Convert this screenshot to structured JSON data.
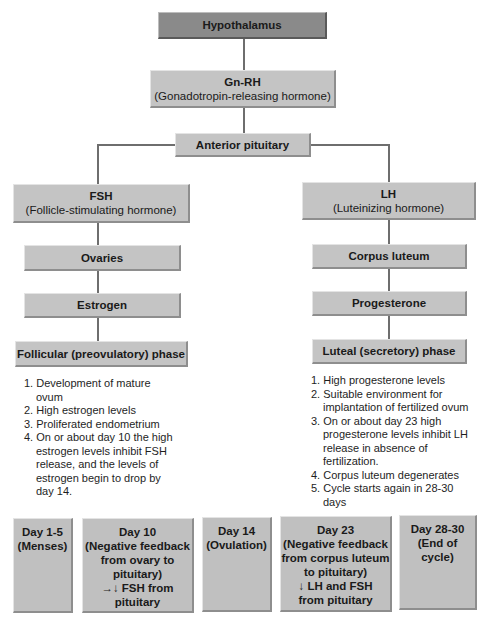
{
  "top": {
    "hypothalamus": "Hypothalamus",
    "gnrh_title": "Gn-RH",
    "gnrh_sub": "(Gonadotropin-releasing hormone)",
    "anterior_pituitary": "Anterior pituitary"
  },
  "left": {
    "fsh_title": "FSH",
    "fsh_sub": "(Follicle-stimulating hormone)",
    "ovaries": "Ovaries",
    "estrogen": "Estrogen",
    "phase": "Follicular (preovulatory) phase",
    "list": [
      "1. Development of mature ovum",
      "2. High estrogen levels",
      "3. Proliferated endometrium",
      "4. On or about day 10 the high estrogen levels inhibit FSH release, and the levels of estrogen begin to drop by day 14."
    ]
  },
  "right": {
    "lh_title": "LH",
    "lh_sub": "(Luteinizing hormone)",
    "corpus_luteum": "Corpus luteum",
    "progesterone": "Progesterone",
    "phase": "Luteal (secretory) phase",
    "list": [
      "1. High progesterone levels",
      "2. Suitable environment for implantation of fertilized ovum",
      "3. On or about day 23 high progesterone levels inhibit LH release in absence of fertilization.",
      "4. Corpus luteum degenerates",
      "5. Cycle starts again in 28-30 days"
    ]
  },
  "days": [
    {
      "lines": [
        "Day 1-5",
        "(Menses)"
      ]
    },
    {
      "lines": [
        "Day 10",
        "(Negative feedback",
        "from ovary to",
        "pituitary)",
        "→↓ FSH from",
        "pituitary"
      ]
    },
    {
      "lines": [
        "Day 14",
        "(Ovulation)"
      ]
    },
    {
      "lines": [
        "Day 23",
        "(Negative feedback",
        "from corpus luteum",
        "to pituitary)",
        "↓ LH and FSH",
        "from pituitary"
      ]
    },
    {
      "lines": [
        "Day 28-30",
        "(End of cycle)"
      ]
    }
  ]
}
